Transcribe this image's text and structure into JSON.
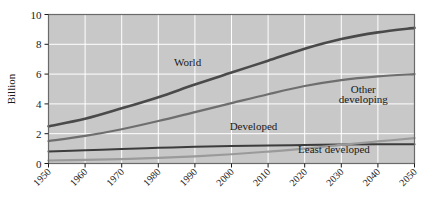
{
  "chart_data": {
    "type": "line",
    "title": "",
    "xlabel": "",
    "ylabel": "Billion",
    "xlim": [
      1950,
      2050
    ],
    "ylim": [
      0,
      10
    ],
    "grid": true,
    "legend_position": "inline-annotations",
    "x": [
      1950,
      1960,
      1970,
      1980,
      1990,
      2000,
      2010,
      2020,
      2030,
      2040,
      2050
    ],
    "categories": [
      "1950",
      "1960",
      "1970",
      "1980",
      "1990",
      "2000",
      "2010",
      "2020",
      "2030",
      "2040",
      "2050"
    ],
    "ytick_labels": [
      "0",
      "2",
      "4",
      "6",
      "8",
      "10"
    ],
    "ytick_values": [
      0,
      2,
      4,
      6,
      8,
      10
    ],
    "series": [
      {
        "name": "World",
        "color": "#4a4a4a",
        "width": 2.6,
        "values": [
          2.5,
          3.0,
          3.7,
          4.45,
          5.3,
          6.1,
          6.9,
          7.7,
          8.35,
          8.8,
          9.1
        ]
      },
      {
        "name": "Other developing",
        "color": "#6e6e6e",
        "width": 2.2,
        "values": [
          1.5,
          1.85,
          2.3,
          2.85,
          3.45,
          4.05,
          4.65,
          5.2,
          5.6,
          5.85,
          6.0
        ]
      },
      {
        "name": "Developed",
        "color": "#3c3c3c",
        "width": 2.0,
        "values": [
          0.81,
          0.89,
          0.98,
          1.05,
          1.12,
          1.17,
          1.21,
          1.24,
          1.27,
          1.29,
          1.3
        ]
      },
      {
        "name": "Least developed",
        "color": "#9a9a9a",
        "width": 2.2,
        "values": [
          0.2,
          0.24,
          0.3,
          0.38,
          0.48,
          0.62,
          0.8,
          1.0,
          1.25,
          1.48,
          1.7
        ]
      }
    ],
    "annotations": [
      {
        "text": "World",
        "x": 1988,
        "y": 6.55
      },
      {
        "text": "Other",
        "x": 2036,
        "y": 4.75
      },
      {
        "text": "developing",
        "x": 2036,
        "y": 4.05
      },
      {
        "text": "Developed",
        "x": 2006,
        "y": 2.25
      },
      {
        "text": "Least developed",
        "x": 2028,
        "y": 0.72
      }
    ]
  },
  "plot": {
    "bg_color": "#c8c8c8",
    "grid_color": "#ffffff",
    "frame_color": "#6a6a6a"
  }
}
